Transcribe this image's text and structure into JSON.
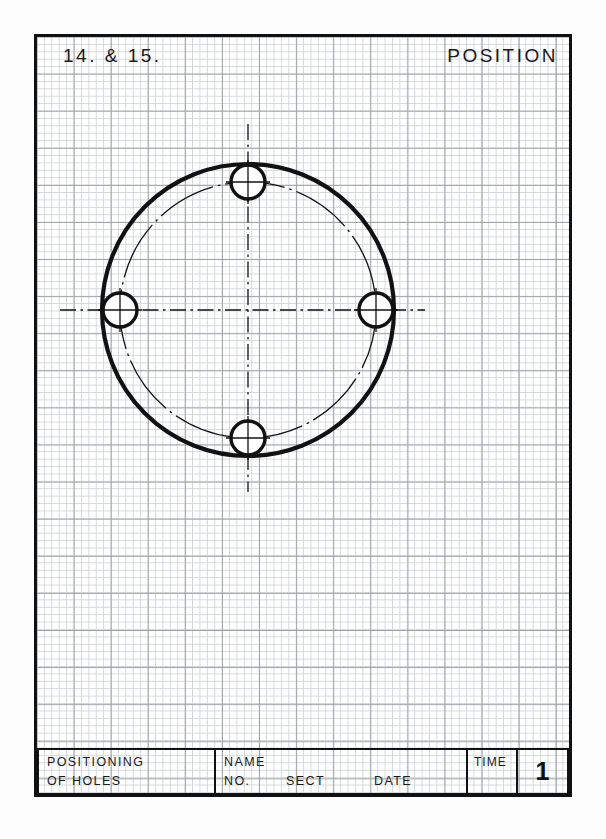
{
  "sheet": {
    "width": 606,
    "height": 839,
    "background": "#ffffff",
    "border_color": "#111111",
    "grid": {
      "minor_color": "#d3d7da",
      "major_color": "#9ea3a8",
      "minor_spacing_px": 7.42,
      "major_every": 5
    }
  },
  "header": {
    "exercise_label": "14.  &  15.",
    "title": "POSITION"
  },
  "drawing": {
    "name": "bolt-hole-circle-flange",
    "line_color": "#111111",
    "center": {
      "x": 248,
      "y": 310
    },
    "outer_circle": {
      "label": "outer circle",
      "radius": 146,
      "stroke_width": 4.2
    },
    "bolt_circle": {
      "label": "bolt circle",
      "radius": 128,
      "stroke_width": 1.3,
      "style": "dash-dot"
    },
    "holes": [
      {
        "label": "top hole",
        "cx": 248,
        "cy": 182,
        "r": 17,
        "stroke_width": 3.4
      },
      {
        "label": "right hole",
        "cx": 376,
        "cy": 310,
        "r": 17,
        "stroke_width": 3.4
      },
      {
        "label": "bottom hole",
        "cx": 248,
        "cy": 438,
        "r": 17,
        "stroke_width": 3.4
      },
      {
        "label": "left hole",
        "cx": 120,
        "cy": 310,
        "r": 17,
        "stroke_width": 3.4
      }
    ],
    "centerlines": {
      "horizontal": {
        "x1": 60,
        "y1": 310,
        "x2": 425,
        "y2": 310
      },
      "vertical": {
        "x1": 248,
        "y1": 124,
        "x2": 248,
        "y2": 492
      },
      "style": "dash-dot",
      "stroke_width": 1.3
    }
  },
  "title_block": {
    "description_line1": "POSITIONING",
    "description_line2": "OF  HOLES",
    "name_label": "NAME",
    "no_label": "NO.",
    "sect_label": "SECT",
    "date_label": "DATE",
    "time_label": "TIME",
    "sheet_number": "1"
  }
}
